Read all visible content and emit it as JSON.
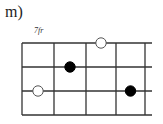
{
  "diagram": {
    "label": "m)",
    "fret_position": "7fr",
    "strings": 4,
    "frets": 4,
    "open_extension": true,
    "markers": [
      {
        "string": 1,
        "fret": 3,
        "type": "open",
        "color": "#ffffff"
      },
      {
        "string": 2,
        "fret": 2,
        "type": "filled",
        "color": "#000000"
      },
      {
        "string": 3,
        "fret": 1,
        "type": "open",
        "color": "#ffffff"
      },
      {
        "string": 3,
        "fret": 4,
        "type": "filled",
        "color": "#000000"
      }
    ]
  }
}
